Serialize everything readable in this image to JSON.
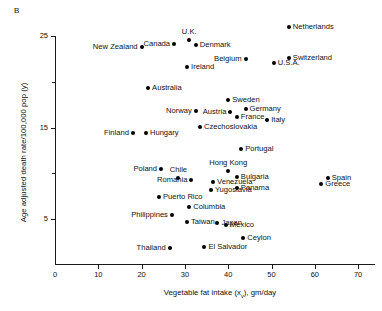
{
  "panel": {
    "letter": "B"
  },
  "chart_data": {
    "type": "scatter",
    "title": "",
    "xlabel": "Vegetable fat intake (xᵥ), gm/day",
    "ylabel": "Age adjusted death rate/100,000 pop (y)",
    "xlim": [
      0,
      72
    ],
    "ylim": [
      0,
      26.5
    ],
    "xticks": [
      0,
      10,
      20,
      30,
      40,
      50,
      60,
      70
    ],
    "xtick_labels": [
      "0",
      "10",
      "20",
      "30",
      "40",
      "50",
      "60",
      "70"
    ],
    "yticks": [
      5,
      15,
      25
    ],
    "ytick_labels": [
      "5",
      "15",
      "25"
    ],
    "yticks_minor": [
      10,
      20
    ],
    "grid": false,
    "legend": false,
    "points": [
      {
        "name": "Netherlands",
        "x": 54.0,
        "y": 26.0,
        "label_pos": "right"
      },
      {
        "name": "U.K.",
        "x": 31.0,
        "y": 24.6,
        "label_pos": "above"
      },
      {
        "name": "Canada",
        "x": 27.5,
        "y": 24.1,
        "label_pos": "left"
      },
      {
        "name": "Denmark",
        "x": 32.5,
        "y": 24.0,
        "label_pos": "right"
      },
      {
        "name": "New Zealand",
        "x": 20.0,
        "y": 23.8,
        "label_pos": "left"
      },
      {
        "name": "Switzerland",
        "x": 54.0,
        "y": 22.6,
        "label_pos": "right"
      },
      {
        "name": "Belgium",
        "x": 44.0,
        "y": 22.5,
        "label_pos": "left"
      },
      {
        "name": "U.S.A.",
        "x": 50.5,
        "y": 22.1,
        "label_pos": "right"
      },
      {
        "name": "Ireland",
        "x": 30.5,
        "y": 21.6,
        "label_pos": "right"
      },
      {
        "name": "Australia",
        "x": 21.5,
        "y": 19.3,
        "label_pos": "right"
      },
      {
        "name": "Sweden",
        "x": 40.0,
        "y": 18.0,
        "label_pos": "right"
      },
      {
        "name": "Germany",
        "x": 44.0,
        "y": 17.0,
        "label_pos": "right"
      },
      {
        "name": "Austria",
        "x": 40.5,
        "y": 16.7,
        "label_pos": "left"
      },
      {
        "name": "Norway",
        "x": 32.5,
        "y": 16.8,
        "label_pos": "left"
      },
      {
        "name": "France",
        "x": 42.0,
        "y": 16.1,
        "label_pos": "right"
      },
      {
        "name": "Italy",
        "x": 49.0,
        "y": 15.8,
        "label_pos": "right"
      },
      {
        "name": "Czechoslovakia",
        "x": 33.5,
        "y": 15.1,
        "label_pos": "right"
      },
      {
        "name": "Hungary",
        "x": 21.0,
        "y": 14.4,
        "label_pos": "right"
      },
      {
        "name": "Finland",
        "x": 18.0,
        "y": 14.4,
        "label_pos": "left"
      },
      {
        "name": "Portugal",
        "x": 43.0,
        "y": 12.6,
        "label_pos": "right"
      },
      {
        "name": "Poland",
        "x": 24.5,
        "y": 10.5,
        "label_pos": "left"
      },
      {
        "name": "Hong Kong",
        "x": 40.0,
        "y": 10.2,
        "label_pos": "above"
      },
      {
        "name": "Bulgaria",
        "x": 42.0,
        "y": 9.6,
        "label_pos": "right"
      },
      {
        "name": "Spain",
        "x": 63.0,
        "y": 9.5,
        "label_pos": "right"
      },
      {
        "name": "Chile",
        "x": 28.5,
        "y": 9.5,
        "label_pos": "above"
      },
      {
        "name": "Romania",
        "x": 31.5,
        "y": 9.3,
        "label_pos": "left"
      },
      {
        "name": "Venezuela",
        "x": 36.5,
        "y": 9.0,
        "label_pos": "right"
      },
      {
        "name": "Greece",
        "x": 61.5,
        "y": 8.8,
        "label_pos": "right"
      },
      {
        "name": "Yugoslavia",
        "x": 36.0,
        "y": 8.2,
        "label_pos": "right"
      },
      {
        "name": "Panama",
        "x": 42.0,
        "y": 8.4,
        "label_pos": "right"
      },
      {
        "name": "Puerto Rico",
        "x": 24.0,
        "y": 7.4,
        "label_pos": "right"
      },
      {
        "name": "Columbia",
        "x": 31.0,
        "y": 6.3,
        "label_pos": "right"
      },
      {
        "name": "Philippines",
        "x": 27.0,
        "y": 5.4,
        "label_pos": "left"
      },
      {
        "name": "Taiwan",
        "x": 30.5,
        "y": 4.7,
        "label_pos": "right"
      },
      {
        "name": "Japan",
        "x": 37.5,
        "y": 4.6,
        "label_pos": "right"
      },
      {
        "name": "Mexico",
        "x": 39.5,
        "y": 4.3,
        "label_pos": "right"
      },
      {
        "name": "Ceylon",
        "x": 43.5,
        "y": 2.9,
        "label_pos": "right"
      },
      {
        "name": "Thailand",
        "x": 26.5,
        "y": 1.8,
        "label_pos": "left"
      },
      {
        "name": "El Salvador",
        "x": 34.5,
        "y": 1.9,
        "label_pos": "right"
      }
    ]
  }
}
